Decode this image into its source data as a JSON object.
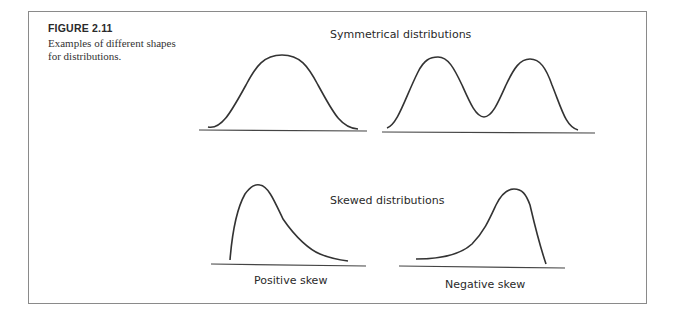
{
  "figure": {
    "label": "FIGURE 2.11",
    "caption": "Examples of different shapes for distributions."
  },
  "sections": [
    {
      "title": "Symmetrical distributions",
      "panels": [
        {
          "name": "normal",
          "label": ""
        },
        {
          "name": "bimodal",
          "label": ""
        }
      ]
    },
    {
      "title": "Skewed distributions",
      "panels": [
        {
          "name": "positive-skew",
          "label": "Positive skew"
        },
        {
          "name": "negative-skew",
          "label": "Negative skew"
        }
      ]
    }
  ],
  "colors": {
    "stroke": "#333333",
    "frame": "#8a8a8a"
  }
}
